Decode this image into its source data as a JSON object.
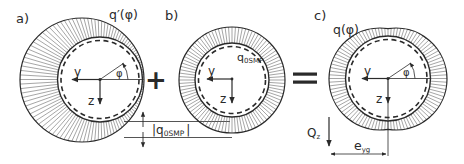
{
  "panels": {
    "a": {
      "label": "a)",
      "load_label_main": "q′(φ)",
      "axis_y": "y",
      "axis_z": "z",
      "angle": "φ"
    },
    "b": {
      "label": "b)",
      "load_label_main": "q",
      "load_label_sub": "0SMP",
      "axis_y": "y",
      "axis_z": "z"
    },
    "c": {
      "label": "c)",
      "load_label_main": "q(φ)",
      "axis_y": "y",
      "axis_z": "z",
      "angle": "φ",
      "force_main": "Q",
      "force_sub": "z",
      "ecc_main": "e",
      "ecc_sub": "yg"
    }
  },
  "operators": {
    "plus": "+",
    "equals": "="
  },
  "dimension": {
    "bar_left": "|",
    "main": "q",
    "sub": "0SMP",
    "bar_right": "|"
  },
  "colors": {
    "stroke": "#2a2a2a",
    "hatch": "#6a6a6a",
    "background": "#ffffff"
  }
}
